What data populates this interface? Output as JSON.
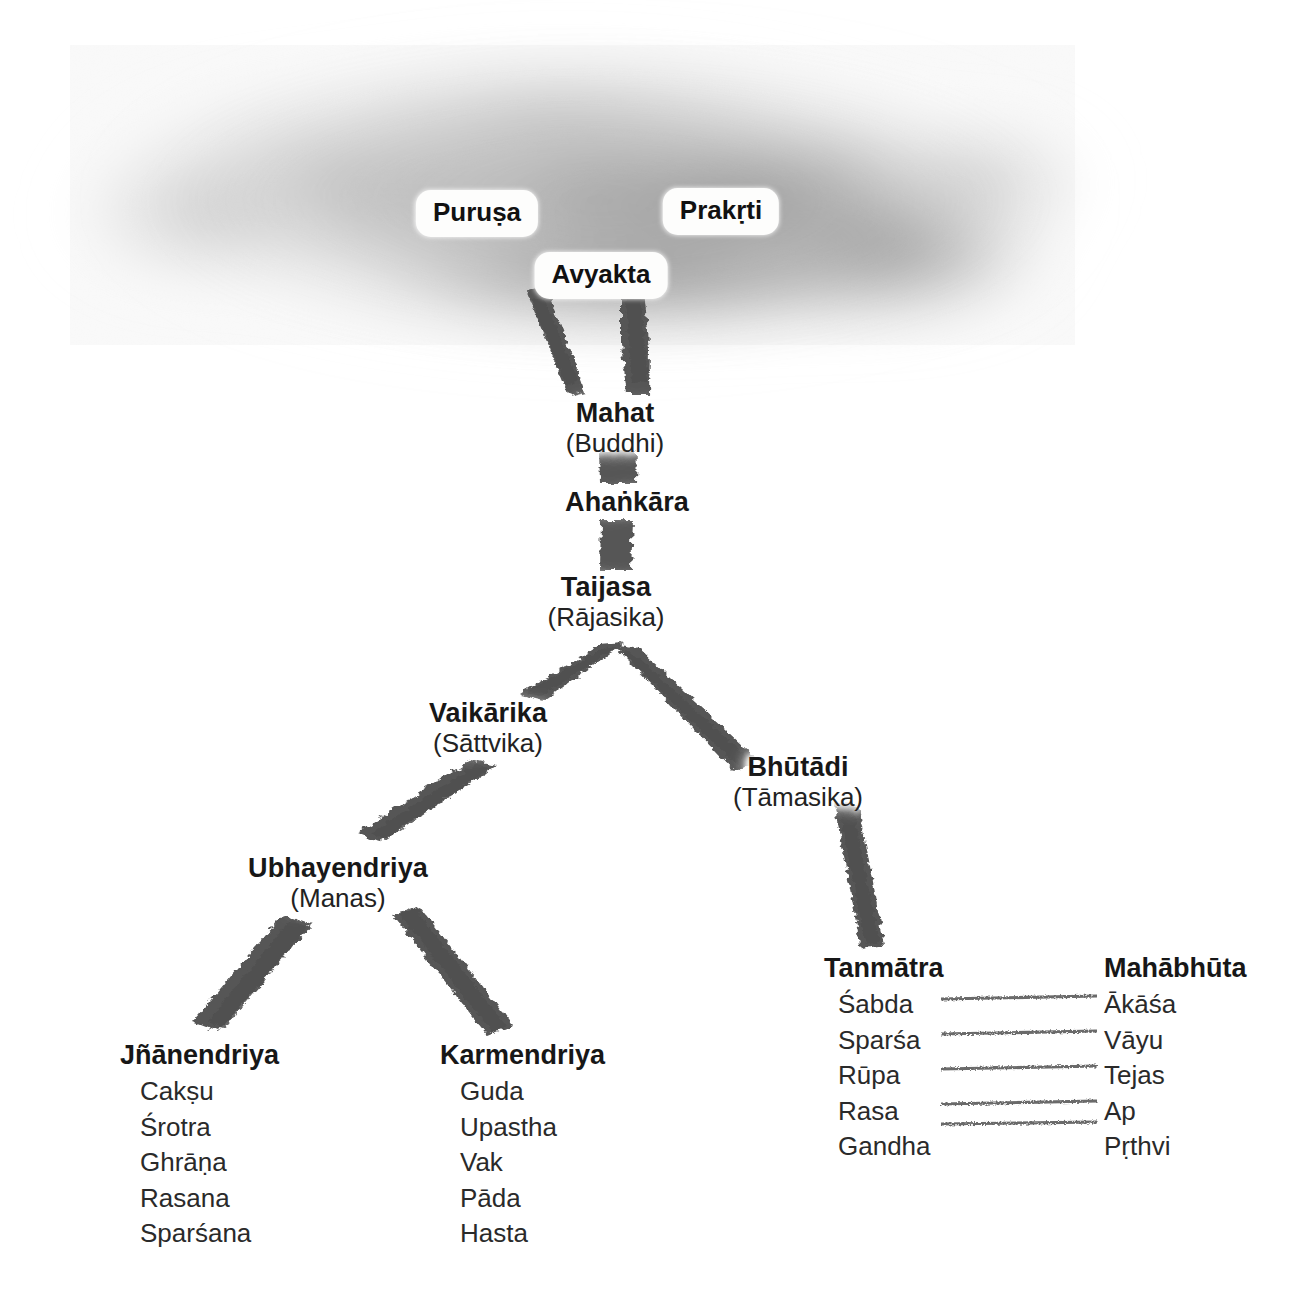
{
  "diagram": {
    "cloud": {
      "name": "unmanifest-cloud",
      "chips": [
        {
          "id": "purusa",
          "label": "Puruṣa",
          "x": 477,
          "y": 192
        },
        {
          "id": "prakrti",
          "label": "Prakṛti",
          "x": 721,
          "y": 191
        },
        {
          "id": "avyakta",
          "label": "Avyakta",
          "x": 601,
          "y": 254
        }
      ]
    },
    "nodes": [
      {
        "id": "mahat",
        "title": "Mahat",
        "sub": "(Buddhi)",
        "x": 615,
        "y": 398
      },
      {
        "id": "ahankara",
        "title": "Ahaṅkāra",
        "sub": "",
        "x": 627,
        "y": 490
      },
      {
        "id": "taijasa",
        "title": "Taijasa",
        "sub": "(Rājasika)",
        "x": 606,
        "y": 572
      },
      {
        "id": "vaikarika",
        "title": "Vaikārika",
        "sub": "(Sāttvika)",
        "x": 488,
        "y": 699
      },
      {
        "id": "bhutadi",
        "title": "Bhūtādi",
        "sub": "(Tāmasika)",
        "x": 798,
        "y": 753
      },
      {
        "id": "ubhayendriya",
        "title": "Ubhayendriya",
        "sub": "(Manas)",
        "x": 338,
        "y": 855
      }
    ],
    "leaves": [
      {
        "id": "jnanendriya",
        "title": "Jñānendriya",
        "x": 120,
        "y": 1040,
        "items": [
          "Akṣu-placeholder"
        ]
      }
    ],
    "lists": {
      "jnanendriya": {
        "title": "Jñānendriya",
        "items": [
          "Cakṣu",
          "Śrotra",
          "Ghrāṇa",
          "Rasana",
          "Sparśana"
        ]
      },
      "karmendriya": {
        "title": "Karmendriya",
        "items": [
          "Guda",
          "Upastha",
          "Vak",
          "Pāda",
          "Hasta"
        ]
      },
      "tanmatra": {
        "title": "Tanmātra",
        "items": [
          "Śabda",
          "Sparśa",
          "Rūpa",
          "Rasa",
          "Gandha"
        ]
      },
      "mahabhuta": {
        "title": "Mahābhūta",
        "items": [
          "Ākāśa",
          "Vāyu",
          "Tejas",
          "Ap",
          "Pṛthvi"
        ]
      }
    },
    "connectors": {
      "tanmatra_to_mahabhuta_pairs": [
        [
          "Śabda",
          "Ākāśa"
        ],
        [
          "Sparśa",
          "Vāyu"
        ],
        [
          "Rūpa",
          "Tejas"
        ],
        [
          "Rasa",
          "Ap"
        ],
        [
          "Gandha",
          "Pṛthvi"
        ]
      ],
      "count": 5
    },
    "colors": {
      "background": "#ffffff",
      "text": "#171717",
      "stroke": "#545454",
      "cloud_dark": "#8f8f8f",
      "cloud_light": "#c8c8c8",
      "chip_bg": "#fdfdfc"
    }
  }
}
